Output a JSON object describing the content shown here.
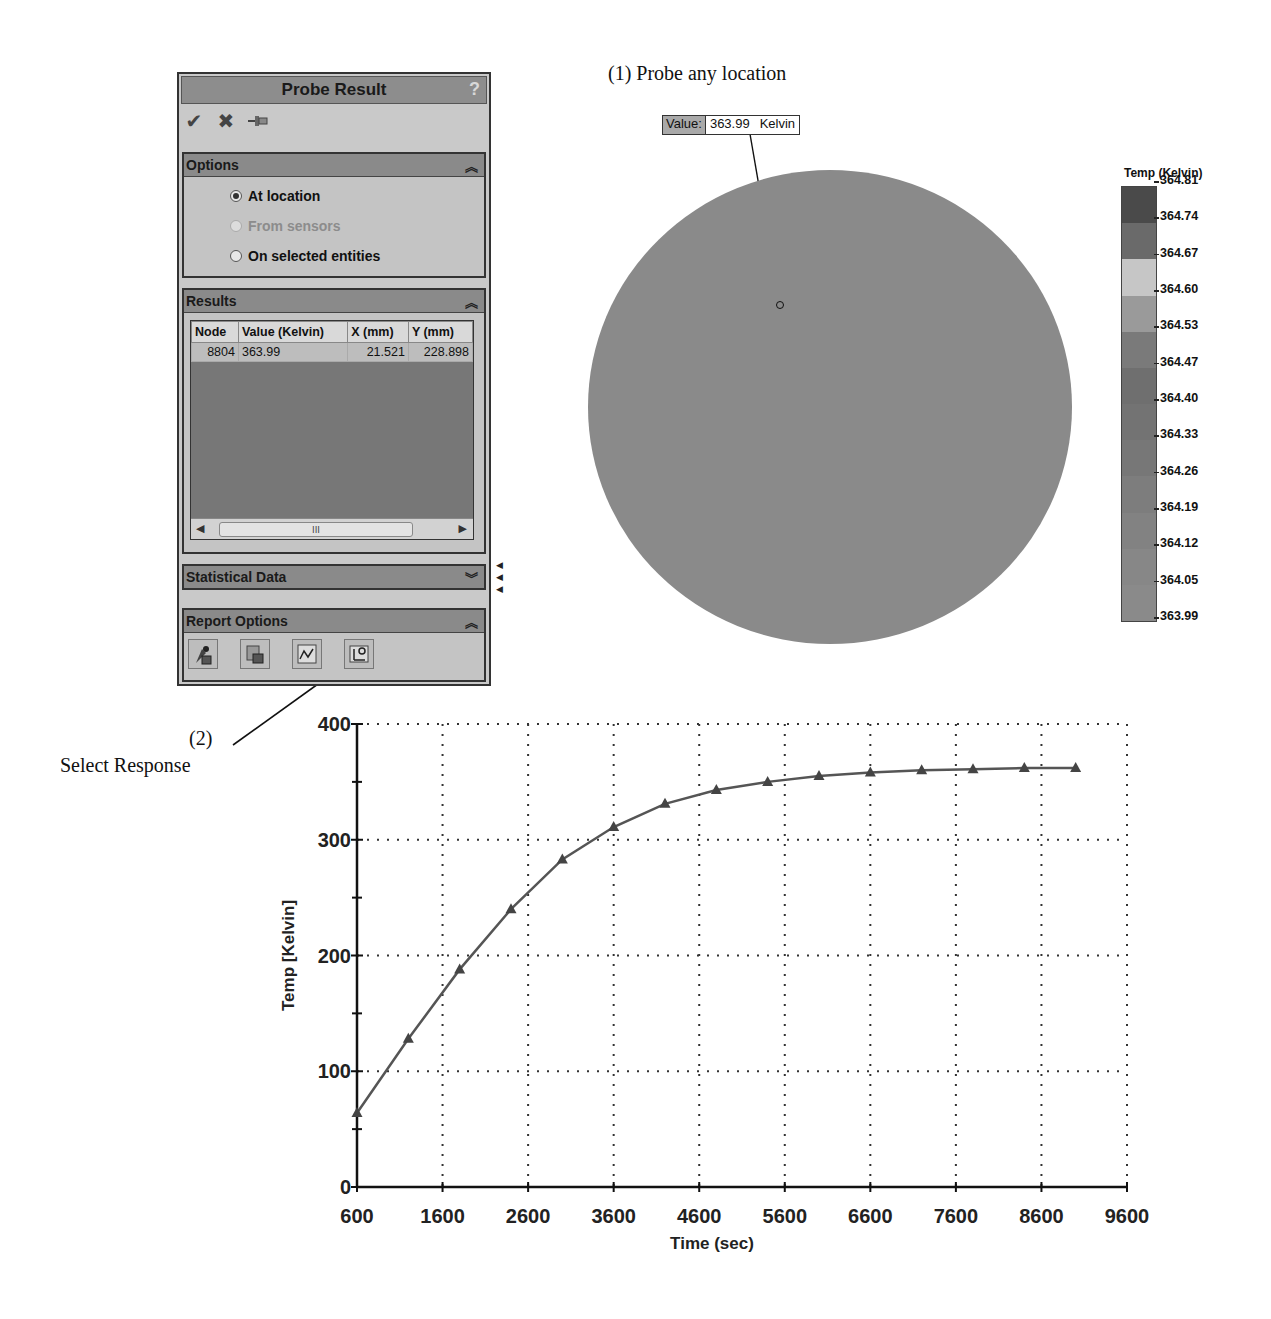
{
  "annotations": {
    "probe_any_location": "(1) Probe any location",
    "step2_number": "(2)",
    "step2_label": "Select Response"
  },
  "panel": {
    "title": "Probe Result",
    "help_icon": "?",
    "toolbar": [
      {
        "name": "ok-check-icon",
        "glyph": "✔"
      },
      {
        "name": "cancel-x-icon",
        "glyph": "✖"
      },
      {
        "name": "pushpin-icon",
        "glyph": "⊣"
      }
    ],
    "options": {
      "title": "Options",
      "items": [
        {
          "label": "At location",
          "checked": true,
          "disabled": false
        },
        {
          "label": "From sensors",
          "checked": false,
          "disabled": true
        },
        {
          "label": "On selected entities",
          "checked": false,
          "disabled": false
        }
      ]
    },
    "results": {
      "title": "Results",
      "columns": [
        "Node",
        "Value (Kelvin)",
        "X (mm)",
        "Y (mm)"
      ],
      "rows": [
        {
          "node": "8804",
          "value": "363.99",
          "x": "21.521",
          "y": "228.898"
        }
      ],
      "scroll_thumb_glyph": "III"
    },
    "statistical_data": {
      "title": "Statistical Data"
    },
    "report_options": {
      "title": "Report Options",
      "buttons": [
        "save-report-icon",
        "save-data-icon",
        "plot-icon",
        "response-icon"
      ]
    }
  },
  "fringe_plot": {
    "probe_tag": {
      "key": "Value:",
      "value": "363.99",
      "unit": "Kelvin"
    },
    "legend": {
      "title": "Temp (Kelvin)",
      "labels": [
        "364.81",
        "364.74",
        "364.67",
        "364.60",
        "364.53",
        "364.47",
        "364.40",
        "364.33",
        "364.26",
        "364.19",
        "364.12",
        "364.05",
        "363.99"
      ],
      "band_colors": [
        "#4a4a4a",
        "#6a6a6a",
        "#c6c6c6",
        "#9a9a9a",
        "#7a7a7a",
        "#6f6f6f",
        "#737373",
        "#777777",
        "#7d7d7d",
        "#828282",
        "#878787",
        "#8a8a8a"
      ]
    },
    "disk_color": "#8a8a8a"
  },
  "chart_data": {
    "type": "line",
    "title": "",
    "xlabel": "Time (sec)",
    "ylabel": "Temp [Kelvin]",
    "x_ticks": [
      600,
      1600,
      2600,
      3600,
      4600,
      5600,
      6600,
      7600,
      8600,
      9600
    ],
    "y_ticks": [
      0,
      100,
      200,
      300,
      400
    ],
    "xlim": [
      600,
      9600
    ],
    "ylim": [
      0,
      400
    ],
    "grid": true,
    "legend": "none",
    "marker": "triangle",
    "series": [
      {
        "name": "Node 8804",
        "x": [
          600,
          1200,
          1800,
          2400,
          3000,
          3600,
          4200,
          4800,
          5400,
          6000,
          6600,
          7200,
          7800,
          8400,
          9000
        ],
        "values": [
          64,
          128,
          188,
          240,
          283,
          311,
          331,
          343,
          350,
          355,
          358,
          360,
          361,
          362,
          362
        ]
      }
    ]
  }
}
